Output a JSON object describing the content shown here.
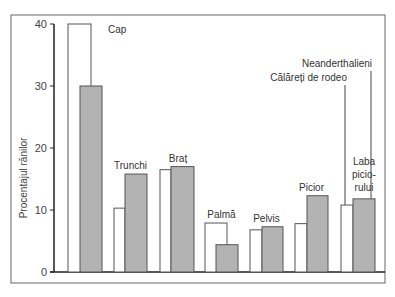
{
  "chart_data": {
    "type": "bar",
    "title": "",
    "xlabel": "",
    "ylabel": "Procentajul rănilor",
    "ylim": [
      0,
      40
    ],
    "yticks": [
      0,
      10,
      20,
      30,
      40
    ],
    "grid": false,
    "legend_position": "top-right (leader lines to last group)",
    "categories": [
      "Cap",
      "Trunchi",
      "Braț",
      "Palmă",
      "Pelvis",
      "Picior",
      "Laba piciorului"
    ],
    "category_label_lines": [
      [
        "Cap"
      ],
      [
        "Trunchi"
      ],
      [
        "Braț"
      ],
      [
        "Palmă"
      ],
      [
        "Pelvis"
      ],
      [
        "Picior"
      ],
      [
        "Laba",
        "picio-",
        "rului"
      ]
    ],
    "series": [
      {
        "name": "Călăreți de rodeo",
        "color": "#ffffff",
        "values": [
          40,
          10.3,
          16.5,
          7.9,
          6.8,
          7.8,
          10.8
        ]
      },
      {
        "name": "Neanderthalieni",
        "color": "#b3b3b3",
        "values": [
          30,
          15.8,
          17,
          4.4,
          7.3,
          12.3,
          11.8
        ]
      }
    ]
  },
  "colors": {
    "frame": "#555555",
    "axis": "#222222",
    "bar_outline": "#555555",
    "grey_fill": "#b3b3b3",
    "white_fill": "#ffffff"
  }
}
